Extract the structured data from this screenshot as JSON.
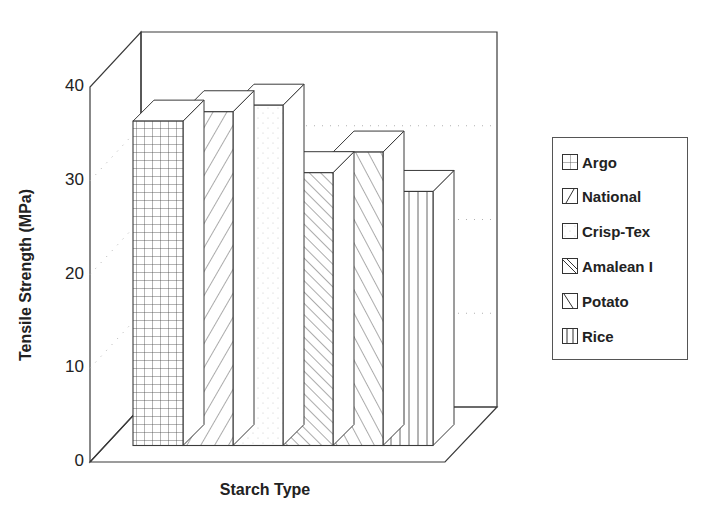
{
  "chart_data": {
    "type": "bar",
    "style": "3d",
    "title": "",
    "xlabel": "Starch Type",
    "ylabel": "Tensile Strength (MPa)",
    "ylim": [
      0,
      40
    ],
    "yticks": [
      0,
      10,
      20,
      30,
      40
    ],
    "grid": true,
    "legend_position": "right",
    "categories": [
      "Argo",
      "National",
      "Crisp-Tex",
      "Amalean I",
      "Potato",
      "Rice"
    ],
    "values": [
      34.6,
      35.6,
      36.3,
      29.1,
      31.3,
      27.1
    ],
    "patterns": [
      "grid",
      "diagonal-up",
      "dots",
      "diagonal-down-dense",
      "diagonal-down-steep",
      "vertical"
    ],
    "legend": [
      "Argo",
      "National",
      "Crisp-Tex",
      "Amalean I",
      "Potato",
      "Rice"
    ]
  },
  "axis": {
    "y_tick_labels": [
      "0",
      "10",
      "20",
      "30",
      "40"
    ],
    "x_title": "Starch Type",
    "y_title": "Tensile Strength (MPa)"
  },
  "colors": {
    "line": "#3a3a3a",
    "background": "#ffffff",
    "grid": "#b0b0b0"
  }
}
